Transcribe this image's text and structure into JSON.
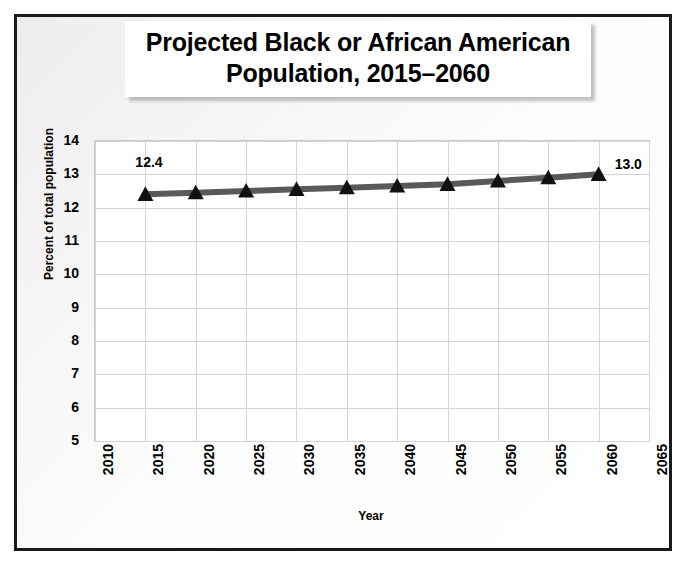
{
  "chart_data": {
    "type": "line",
    "title": "Projected Black or African American Population, 2015–2060",
    "title_lines": [
      "Projected Black or African American",
      "Population, 2015–2060"
    ],
    "xlabel": "Year",
    "ylabel": "Percent of total population",
    "grid": true,
    "legend": "none",
    "xlim": [
      2010,
      2065
    ],
    "ylim": [
      5,
      14
    ],
    "xticks": [
      2010,
      2015,
      2020,
      2025,
      2030,
      2035,
      2040,
      2045,
      2050,
      2055,
      2060,
      2065
    ],
    "xtick_labels": [
      "2010",
      "2015",
      "2020",
      "2025",
      "2030",
      "2035",
      "2040",
      "2045",
      "2050",
      "2055",
      "2060",
      "2065"
    ],
    "yticks": [
      5,
      6,
      7,
      8,
      9,
      10,
      11,
      12,
      13,
      14
    ],
    "ytick_labels": [
      "5",
      "6",
      "7",
      "8",
      "9",
      "10",
      "11",
      "12",
      "13",
      "14"
    ],
    "x": [
      2015,
      2020,
      2025,
      2030,
      2035,
      2040,
      2045,
      2050,
      2055,
      2060
    ],
    "values": [
      12.4,
      12.45,
      12.5,
      12.55,
      12.6,
      12.65,
      12.7,
      12.8,
      12.9,
      13.0
    ],
    "point_labels": {
      "first": "12.4",
      "last": "13.0"
    },
    "marker": "triangle",
    "marker_color": "#111111",
    "line_color": "#595959",
    "line_width": 6
  },
  "style": {
    "frame_border": "#1a1a1a",
    "plot_background": "#ffffff",
    "grid_color": "#d4d4d4",
    "text_color": "#000000"
  }
}
